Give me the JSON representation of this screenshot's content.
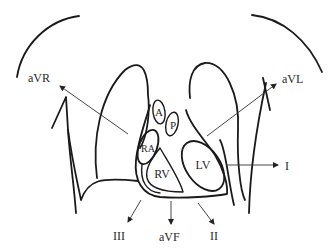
{
  "diagram": {
    "chambers": {
      "A": "A",
      "P": "P",
      "RA": "RA",
      "RV": "RV",
      "LV": "LV"
    },
    "leads": {
      "aVR": "aVR",
      "aVL": "aVL",
      "I": "I",
      "II": "II",
      "III": "III",
      "aVF": "aVF"
    },
    "colors": {
      "stroke": "#1a1a1a",
      "text": "#2a2a2a",
      "background": "#ffffff"
    }
  }
}
